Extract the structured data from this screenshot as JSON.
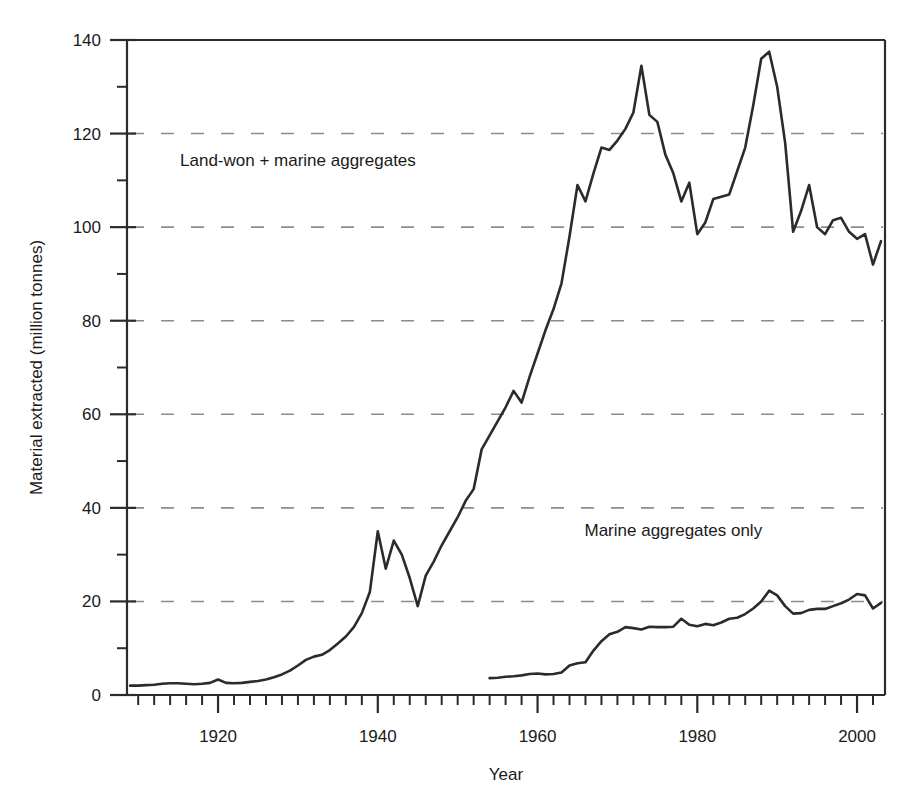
{
  "chart_data": {
    "type": "line",
    "title": "",
    "xlabel": "Year",
    "ylabel": "Material extracted (million tonnes)",
    "xlim": [
      1908.6,
      2003.5
    ],
    "ylim": [
      0,
      140
    ],
    "x_major_ticks": [
      1920,
      1940,
      1960,
      1980,
      2000
    ],
    "x_major_tick_labels": [
      "1920",
      "1940",
      "1960",
      "1980",
      "2000"
    ],
    "x_minor_tick_interval": 2,
    "y_major_ticks": [
      0,
      20,
      40,
      60,
      80,
      100,
      120,
      140
    ],
    "y_major_tick_labels": [
      "0",
      "20",
      "40",
      "60",
      "80",
      "100",
      "120",
      "140"
    ],
    "y_minor_ticks": [
      10,
      30,
      50,
      70,
      90,
      110,
      130
    ],
    "grid": "horizontal-dashed-at-major-y",
    "legend_position": "inline-annotations",
    "line_color": "#2b2b2b",
    "grid_color": "#8c8c8c",
    "axis_color": "#2b2b2b",
    "series": [
      {
        "name": "Land-won + marine aggregates",
        "label_x": 1930,
        "label_y": 113,
        "x": [
          1909,
          1910,
          1911,
          1912,
          1913,
          1914,
          1915,
          1916,
          1917,
          1918,
          1919,
          1920,
          1921,
          1922,
          1923,
          1924,
          1925,
          1926,
          1927,
          1928,
          1929,
          1930,
          1931,
          1932,
          1933,
          1934,
          1935,
          1936,
          1937,
          1938,
          1939,
          1940,
          1941,
          1942,
          1943,
          1944,
          1945,
          1946,
          1947,
          1948,
          1949,
          1950,
          1951,
          1952,
          1953,
          1954,
          1955,
          1956,
          1957,
          1958,
          1959,
          1960,
          1961,
          1962,
          1963,
          1964,
          1965,
          1966,
          1967,
          1968,
          1969,
          1970,
          1971,
          1972,
          1973,
          1974,
          1975,
          1976,
          1977,
          1978,
          1979,
          1980,
          1981,
          1982,
          1983,
          1984,
          1985,
          1986,
          1987,
          1988,
          1989,
          1990,
          1991,
          1992,
          1993,
          1994,
          1995,
          1996,
          1997,
          1998,
          1999,
          2000,
          2001,
          2002,
          2003
        ],
        "y": [
          2.0,
          2.0,
          2.1,
          2.2,
          2.4,
          2.5,
          2.5,
          2.4,
          2.3,
          2.4,
          2.6,
          3.3,
          2.6,
          2.5,
          2.6,
          2.8,
          3.0,
          3.3,
          3.8,
          4.4,
          5.2,
          6.3,
          7.5,
          8.2,
          8.6,
          9.6,
          11.0,
          12.5,
          14.5,
          17.5,
          22.0,
          35.0,
          27.0,
          33.0,
          30.0,
          25.0,
          19.0,
          25.5,
          28.5,
          32.0,
          35.0,
          38.0,
          41.5,
          44.0,
          52.5,
          55.5,
          58.5,
          61.5,
          65.0,
          62.5,
          68.0,
          73.0,
          78.0,
          82.5,
          88.0,
          98.0,
          109.0,
          105.5,
          111.5,
          117.0,
          116.5,
          118.5,
          121.0,
          124.5,
          134.5,
          124.0,
          122.5,
          115.5,
          111.5,
          105.5,
          109.5,
          98.5,
          101.0,
          106.0,
          106.5,
          107.0,
          112.0,
          117.0,
          126.0,
          136.0,
          137.5,
          130.0,
          118.0,
          99.0,
          103.5,
          109.0,
          100.0,
          98.5,
          101.5,
          102.0,
          99.0,
          97.5,
          98.5,
          92.0,
          97.0
        ]
      },
      {
        "name": "Marine aggregates only",
        "label_x": 1977,
        "label_y": 34,
        "x": [
          1954,
          1955,
          1956,
          1957,
          1958,
          1959,
          1960,
          1961,
          1962,
          1963,
          1964,
          1965,
          1966,
          1967,
          1968,
          1969,
          1970,
          1971,
          1972,
          1973,
          1974,
          1975,
          1976,
          1977,
          1978,
          1979,
          1980,
          1981,
          1982,
          1983,
          1984,
          1985,
          1986,
          1987,
          1988,
          1989,
          1990,
          1991,
          1992,
          1993,
          1994,
          1995,
          1996,
          1997,
          1998,
          1999,
          2000,
          2001,
          2002,
          2003
        ],
        "y": [
          3.6,
          3.7,
          3.9,
          4.0,
          4.2,
          4.5,
          4.6,
          4.4,
          4.5,
          4.8,
          6.3,
          6.8,
          7.0,
          9.5,
          11.5,
          13.0,
          13.5,
          14.5,
          14.3,
          14.0,
          14.6,
          14.5,
          14.5,
          14.6,
          16.3,
          15.0,
          14.7,
          15.2,
          14.9,
          15.5,
          16.3,
          16.5,
          17.3,
          18.5,
          20.0,
          22.3,
          21.3,
          19.0,
          17.4,
          17.5,
          18.2,
          18.4,
          18.4,
          19.0,
          19.6,
          20.4,
          21.6,
          21.3,
          18.5,
          19.7
        ]
      }
    ]
  }
}
